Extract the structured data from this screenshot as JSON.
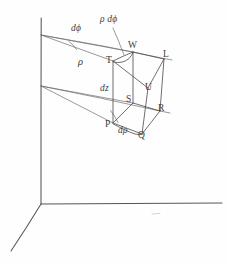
{
  "figure": {
    "kind": "hand-drawn-diagram",
    "background_color": "#fefefe",
    "ink_color": "#4a4a4a",
    "width": 227,
    "height": 265
  },
  "axes": {
    "origin": {
      "x": 41,
      "y": 204
    },
    "vertical_axis": {
      "x1": 41,
      "y1": 18,
      "x2": 41,
      "y2": 204
    },
    "horizontal_axis": {
      "x1": 41,
      "y1": 204,
      "x2": 222,
      "y2": 203
    },
    "oblique_axis": {
      "x1": 41,
      "y1": 204,
      "x2": 11,
      "y2": 251
    }
  },
  "ray_origins": {
    "upper": {
      "x": 41,
      "y": 35
    },
    "lower": {
      "x": 41,
      "y": 86
    }
  },
  "vertices": [
    {
      "name": "T",
      "label": "T",
      "x": 113,
      "y": 61,
      "label_x": 106,
      "label_y": 56
    },
    {
      "name": "W",
      "label": "W",
      "x": 133,
      "y": 52,
      "label_x": 128,
      "label_y": 41
    },
    {
      "name": "L",
      "label": "L",
      "x": 164,
      "y": 59,
      "label_x": 163,
      "label_y": 50
    },
    {
      "name": "U",
      "label": "U",
      "x": 148,
      "y": 88,
      "label_x": 145,
      "label_y": 83
    },
    {
      "name": "S",
      "label": "S",
      "x": 133,
      "y": 103,
      "label_x": 126,
      "label_y": 95
    },
    {
      "name": "R",
      "label": "R",
      "x": 160,
      "y": 111,
      "label_x": 158,
      "label_y": 104
    },
    {
      "name": "P",
      "label": "P",
      "x": 113,
      "y": 123,
      "label_x": 105,
      "label_y": 120
    },
    {
      "name": "Q",
      "label": "Q",
      "x": 142,
      "y": 134,
      "label_x": 138,
      "label_y": 131
    }
  ],
  "annotations": [
    {
      "name": "d-phi",
      "text": "dϕ",
      "x": 71,
      "y": 24,
      "style": "diff"
    },
    {
      "name": "rho-d-phi",
      "text": "ρ dϕ",
      "x": 100,
      "y": 15,
      "style": "diff"
    },
    {
      "name": "rho",
      "text": "ρ",
      "x": 78,
      "y": 57,
      "style": "rho"
    },
    {
      "name": "dz",
      "text": "dz",
      "x": 100,
      "y": 84,
      "style": "diff"
    },
    {
      "name": "d-rho",
      "text": "dρ",
      "x": 118,
      "y": 126,
      "style": "diff"
    }
  ],
  "leader_lines": [
    {
      "name": "rho-d-phi-leader",
      "x1": 113,
      "y1": 28,
      "x2": 124,
      "y2": 55
    }
  ],
  "edges": {
    "top_face": [
      "T-W",
      "W-L",
      "L-U",
      "U-T"
    ],
    "bottom_face": [
      "P-S",
      "S-R",
      "R-Q",
      "Q-P"
    ],
    "vertical": [
      "T-P",
      "W-S",
      "L-R",
      "U-Q"
    ]
  },
  "rays": {
    "upper": [
      {
        "from": "upper-origin",
        "to": "T"
      },
      {
        "from": "upper-origin",
        "to": "W"
      },
      {
        "from": "upper-origin",
        "to": "L"
      }
    ],
    "lower": [
      {
        "from": "lower-origin",
        "to": "P"
      },
      {
        "from": "lower-origin",
        "to": "S"
      },
      {
        "from": "lower-origin",
        "to": "R"
      }
    ]
  },
  "arcs": [
    {
      "name": "d-phi-arc",
      "description": "small arc spanning angle at upper origin"
    },
    {
      "name": "rho-d-phi-arc",
      "description": "arc from T to W along top face"
    },
    {
      "name": "bottom-arc",
      "description": "arc from P to Q along bottom face"
    }
  ]
}
